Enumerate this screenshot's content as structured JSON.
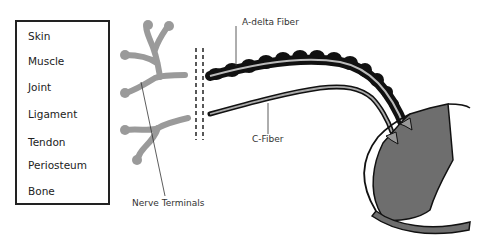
{
  "tissue_list": {
    "items": [
      "Skin",
      "Muscle",
      "Joint",
      "Ligament",
      "Tendon",
      "Periosteum",
      "Bone"
    ]
  },
  "labels": {
    "nerve_terminals": "Nerve Terminals",
    "a_delta_fiber": "A-delta Fiber",
    "c_fiber": "C-Fiber"
  },
  "colors": {
    "terminal_gray": "#9a9a9a",
    "spinal_gray": "#6e6e6e",
    "fiber_black": "#111111",
    "outline": "#222222"
  }
}
